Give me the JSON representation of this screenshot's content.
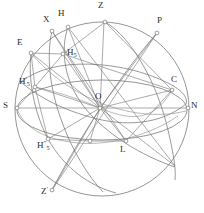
{
  "figure": {
    "type": "celestial-sphere-diagram",
    "stroke_color": "#6e6e6e",
    "label_color": "#2a2a2a",
    "background": "#ffffff",
    "width": 204,
    "height": 213
  },
  "points": [
    {
      "id": "Z",
      "label": "Z",
      "sup": "",
      "sub": "",
      "x": 105,
      "y": 22,
      "lx": 98,
      "ly": 2,
      "marker": true,
      "name": "point-zenith"
    },
    {
      "id": "H",
      "label": "H",
      "sup": "",
      "sub": "",
      "x": 68,
      "y": 27,
      "lx": 58,
      "ly": 10,
      "marker": true,
      "name": "point-h"
    },
    {
      "id": "X",
      "label": "X",
      "sup": "",
      "sub": "",
      "x": 52,
      "y": 31,
      "lx": 44,
      "ly": 16,
      "marker": true,
      "name": "point-x"
    },
    {
      "id": "P",
      "label": "P",
      "sup": "",
      "sub": "",
      "x": 157,
      "y": 33,
      "lx": 158,
      "ly": 17,
      "marker": true,
      "name": "point-pole"
    },
    {
      "id": "E",
      "label": "E",
      "sup": "",
      "sub": "",
      "x": 31,
      "y": 53,
      "lx": 17,
      "ly": 39,
      "marker": true,
      "name": "point-east"
    },
    {
      "id": "H5",
      "label": "H",
      "sup": "",
      "sub": "5",
      "x": 63,
      "y": 54,
      "lx": 67,
      "ly": 49,
      "marker": true,
      "name": "point-h5"
    },
    {
      "id": "C",
      "label": "C",
      "sup": "",
      "sub": "",
      "x": 172,
      "y": 90,
      "lx": 172,
      "ly": 76,
      "marker": true,
      "name": "point-c"
    },
    {
      "id": "H5p",
      "label": "H",
      "sup": "'",
      "sub": "5",
      "x": 35,
      "y": 87,
      "lx": 20,
      "ly": 78,
      "marker": true,
      "name": "point-h5-prime"
    },
    {
      "id": "S",
      "label": "S",
      "sup": "",
      "sub": "",
      "x": 17,
      "y": 108,
      "lx": 3,
      "ly": 102,
      "marker": true,
      "name": "point-south"
    },
    {
      "id": "O",
      "label": "O",
      "sup": "",
      "sub": "",
      "x": 100,
      "y": 108,
      "lx": 96,
      "ly": 93,
      "marker": true,
      "name": "point-origin"
    },
    {
      "id": "N",
      "label": "N",
      "sup": "",
      "sub": "",
      "x": 188,
      "y": 108,
      "lx": 191,
      "ly": 102,
      "marker": true,
      "name": "point-north"
    },
    {
      "id": "H5pp",
      "label": "H",
      "sup": "″",
      "sub": "5",
      "x": 48,
      "y": 139,
      "lx": 38,
      "ly": 142,
      "marker": true,
      "name": "point-h5-double-prime"
    },
    {
      "id": "L",
      "label": "L",
      "sup": "",
      "sub": "",
      "x": 126,
      "y": 141,
      "lx": 121,
      "ly": 146,
      "marker": true,
      "name": "point-l"
    },
    {
      "id": "Zp",
      "label": "Z",
      "sup": "'",
      "sub": "",
      "x": 52,
      "y": 190,
      "lx": 42,
      "ly": 188,
      "marker": true,
      "name": "point-nadir"
    },
    {
      "id": "Q1",
      "label": "",
      "sup": "",
      "sub": "",
      "x": 90,
      "y": 141,
      "lx": 0,
      "ly": 0,
      "marker": true,
      "name": "point-unlabeled-lower"
    },
    {
      "id": "Q2",
      "label": "",
      "sup": "",
      "sub": "",
      "x": 175,
      "y": 166,
      "lx": 0,
      "ly": 0,
      "marker": false,
      "name": "point-unlabeled-lower-right"
    }
  ],
  "circles": {
    "outer": {
      "cx": 102,
      "cy": 109,
      "r": 87,
      "name": "celestial-sphere-outline"
    },
    "horizon_ellipse": {
      "cx": 102,
      "cy": 110,
      "rx": 85,
      "ry": 30,
      "name": "horizon-circle"
    }
  },
  "labels_note": "Celestial sphere: zenith Z, nadir Z', cardinal points S and N, celestial pole P, points E, H, X, C, L and hour-circle feet H5, H5', H5'' about origin O."
}
